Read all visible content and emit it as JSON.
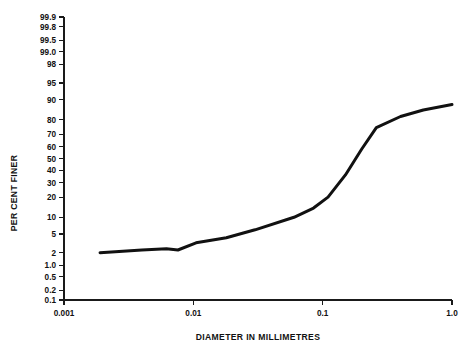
{
  "chart_data": {
    "type": "line",
    "title": "",
    "xlabel": "DIAMETER IN MILLIMETRES",
    "ylabel": "PER CENT FINER",
    "xscale": "log",
    "yscale": "probability",
    "xlim": [
      0.001,
      1.0
    ],
    "ylim": [
      0.1,
      99.9
    ],
    "grid": false,
    "legend": null,
    "xticks": [
      {
        "value": 0.001,
        "label": "0.001"
      },
      {
        "value": 0.01,
        "label": "0.01"
      },
      {
        "value": 0.1,
        "label": "0.1"
      },
      {
        "value": 1.0,
        "label": "1.0"
      }
    ],
    "yticks": [
      {
        "value": 99.9,
        "label": "99.9"
      },
      {
        "value": 99.8,
        "label": "99.8"
      },
      {
        "value": 99.5,
        "label": "99.5"
      },
      {
        "value": 99.0,
        "label": "99.0"
      },
      {
        "value": 98,
        "label": "98"
      },
      {
        "value": 95,
        "label": "95"
      },
      {
        "value": 90,
        "label": "90"
      },
      {
        "value": 80,
        "label": "80"
      },
      {
        "value": 70,
        "label": "70"
      },
      {
        "value": 60,
        "label": "60"
      },
      {
        "value": 50,
        "label": "50"
      },
      {
        "value": 40,
        "label": "40"
      },
      {
        "value": 30,
        "label": "30"
      },
      {
        "value": 20,
        "label": "20"
      },
      {
        "value": 10,
        "label": "10"
      },
      {
        "value": 5,
        "label": "5"
      },
      {
        "value": 2,
        "label": "2"
      },
      {
        "value": 1.0,
        "label": "1.0"
      },
      {
        "value": 0.5,
        "label": "0.5"
      },
      {
        "value": 0.2,
        "label": "0.2"
      },
      {
        "value": 0.1,
        "label": "0.1"
      }
    ],
    "series": [
      {
        "name": "grading curve",
        "color": "#111111",
        "points": [
          {
            "x": 0.0019,
            "y": 2.0
          },
          {
            "x": 0.004,
            "y": 2.3
          },
          {
            "x": 0.0062,
            "y": 2.45
          },
          {
            "x": 0.0076,
            "y": 2.3
          },
          {
            "x": 0.0105,
            "y": 3.3
          },
          {
            "x": 0.018,
            "y": 4.2
          },
          {
            "x": 0.03,
            "y": 6.0
          },
          {
            "x": 0.06,
            "y": 10.0
          },
          {
            "x": 0.085,
            "y": 14.0
          },
          {
            "x": 0.11,
            "y": 20.0
          },
          {
            "x": 0.15,
            "y": 36.0
          },
          {
            "x": 0.2,
            "y": 58.0
          },
          {
            "x": 0.26,
            "y": 75.0
          },
          {
            "x": 0.4,
            "y": 82.0
          },
          {
            "x": 0.6,
            "y": 85.5
          },
          {
            "x": 1.0,
            "y": 88.0
          }
        ]
      }
    ]
  },
  "figure": {
    "background_color": "#ffffff",
    "line_color": "#111111",
    "axis_color": "#1a1a1a"
  }
}
